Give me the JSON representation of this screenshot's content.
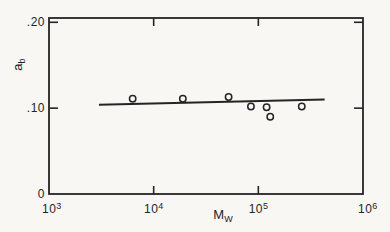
{
  "figure": {
    "background": "#f8f7f4",
    "ink": "#242424",
    "kind": "scanned scientific scatter plot"
  },
  "chart_data": {
    "type": "scatter",
    "title": "",
    "xlabel": "M_W",
    "ylabel": "a_b",
    "grid": false,
    "frame": "box-with-inward-ticks",
    "x_axis": {
      "scale": "log",
      "min": 1000,
      "max": 1000000,
      "title": {
        "base": "M",
        "sub": "W"
      },
      "ticks": [
        {
          "base": "10",
          "exp": "3",
          "value": 1000,
          "mark": false,
          "align": "corner-left"
        },
        {
          "base": "10",
          "exp": "4",
          "value": 10000,
          "mark": true,
          "align": "center"
        },
        {
          "base": "10",
          "exp": "5",
          "value": 100000,
          "mark": true,
          "align": "center"
        },
        {
          "base": "10",
          "exp": "6",
          "value": 1000000,
          "mark": false,
          "align": "corner-right"
        }
      ]
    },
    "y_axis": {
      "scale": "linear",
      "min": 0,
      "max": 0.205,
      "title": {
        "base": "a",
        "sub": "b"
      },
      "ticks": [
        {
          "label": "0",
          "value": 0,
          "mark": false
        },
        {
          "label": ".10",
          "value": 0.1,
          "mark": true
        },
        {
          "label": ".20",
          "value": 0.2,
          "mark": true
        }
      ]
    },
    "series": [
      {
        "name": "experimental-points",
        "marker": "open-circle",
        "points": [
          {
            "x": 6300,
            "y": 0.111
          },
          {
            "x": 19000,
            "y": 0.111
          },
          {
            "x": 52000,
            "y": 0.113
          },
          {
            "x": 85000,
            "y": 0.102
          },
          {
            "x": 120000,
            "y": 0.101
          },
          {
            "x": 130000,
            "y": 0.09
          },
          {
            "x": 260000,
            "y": 0.102
          }
        ]
      }
    ],
    "fit_line": {
      "x1": 3000,
      "y1": 0.104,
      "x2": 430000,
      "y2": 0.11
    }
  }
}
